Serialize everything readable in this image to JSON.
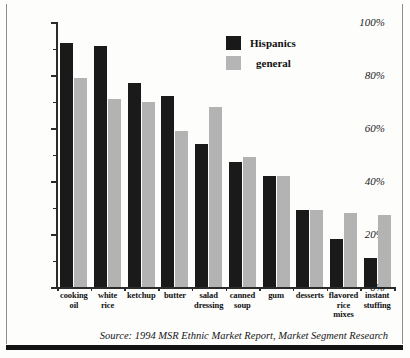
{
  "chart_data": {
    "type": "bar",
    "title": "",
    "subtitle": "",
    "xlabel": "",
    "ylabel": "",
    "ylim": [
      0,
      100
    ],
    "ytick_values": [
      0,
      20,
      40,
      60,
      80,
      100
    ],
    "ytick_labels": [
      "0%",
      "20%",
      "40%",
      "60%",
      "80%",
      "100%"
    ],
    "yminor_values": [
      10,
      30,
      50,
      70,
      90
    ],
    "grid": false,
    "legend_position": "top-right",
    "categories": [
      "cooking oil",
      "white rice",
      "ketchup",
      "butter",
      "salad dressing",
      "canned soup",
      "gum",
      "desserts",
      "flavored rice mixes",
      "instant stuffing"
    ],
    "category_lines": [
      [
        "cooking",
        "oil"
      ],
      [
        "white",
        "rice"
      ],
      [
        "ketchup"
      ],
      [
        "butter"
      ],
      [
        "salad",
        "dressing"
      ],
      [
        "canned",
        "soup"
      ],
      [
        "gum"
      ],
      [
        "desserts"
      ],
      [
        "flavored",
        "rice",
        "mixes"
      ],
      [
        "instant",
        "stuffing"
      ]
    ],
    "series": [
      {
        "name": "Hispanics",
        "color": "#1a1a1a",
        "values": [
          92,
          91,
          77,
          72,
          54,
          47,
          42,
          29,
          18,
          11
        ]
      },
      {
        "name": "general",
        "color": "#b3b3b3",
        "values": [
          79,
          71,
          70,
          59,
          68,
          49,
          42,
          29,
          28,
          27
        ]
      }
    ],
    "annotations": [
      "Source: 1994 MSR Ethnic Market Report, Market Segment Research"
    ]
  },
  "legend": {
    "items": [
      {
        "label": "Hispanics",
        "color": "#191919"
      },
      {
        "label": "general",
        "color": "#b5b5b5"
      }
    ]
  },
  "source_note": {
    "prefix": "Source:",
    "text": "1994 MSR Ethnic Market Report, Market Segment Research",
    "full": "Source: 1994 MSR Ethnic Market Report, Market Segment Research"
  }
}
